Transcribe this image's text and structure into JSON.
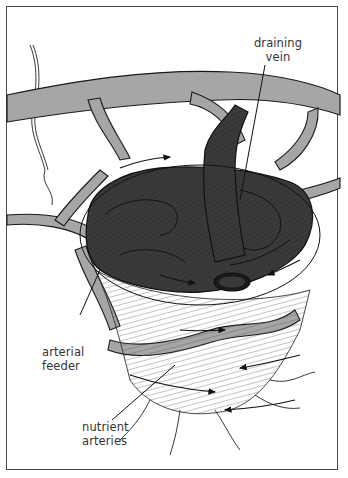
{
  "figure": {
    "labels": [
      {
        "id": "draining_vein",
        "line1": "draining",
        "line2": "vein"
      },
      {
        "id": "arterial_feeder",
        "line1": "arterial",
        "line2": "feeder"
      },
      {
        "id": "nutrient_arteries",
        "line1": "nutrient",
        "line2": "arteries"
      }
    ]
  },
  "colors": {
    "frame": "#4a4a4a",
    "vessel_fill": "#a6a6a6",
    "nidus_fill": "#3a3a3a",
    "outline": "#1a1a1a",
    "background": "#ffffff"
  }
}
